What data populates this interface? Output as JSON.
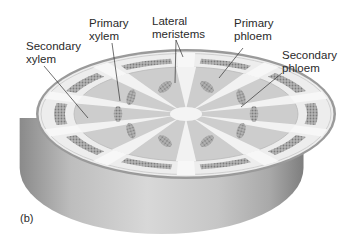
{
  "figure": {
    "panel_label": "(b)",
    "labels": {
      "secondary_xylem": "Secondary\nxylem",
      "primary_xylem": "Primary\nxylem",
      "lateral_meristems": "Lateral\nmeristems",
      "primary_phloem": "Primary\nphloem",
      "secondary_phloem": "Secondary\nphloem"
    },
    "structure": {
      "vascular_bundle_count": 10,
      "ray_count": 10
    },
    "colors": {
      "side_dark": "#8c8c8c",
      "side_light": "#d4d4d4",
      "rim": "#9a9a9a",
      "cortex": "#ececec",
      "xylem_fill": "#c9c9c9",
      "ray": "#f4f4f4",
      "cell_cluster": "#9d9d9d",
      "leader": "#333333"
    }
  }
}
